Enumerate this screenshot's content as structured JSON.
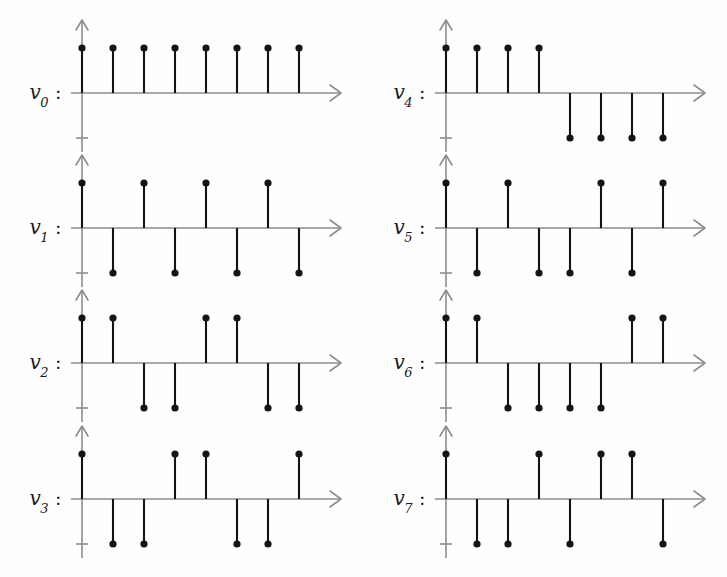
{
  "figure": {
    "columns": 2,
    "rows": 4,
    "background_color": "#fefefe",
    "stem_color": "#141414",
    "axis_color": "#8d8d8d"
  },
  "chart_data": {
    "type": "bar",
    "title": "",
    "xlabel": "",
    "ylabel": "",
    "ylim": [
      -1,
      1
    ],
    "grid": false,
    "legend": "none",
    "x": [
      0,
      1,
      2,
      3,
      4,
      5,
      6,
      7
    ],
    "series": [
      {
        "name": "v0",
        "values": [
          1,
          1,
          1,
          1,
          1,
          1,
          1,
          1
        ]
      },
      {
        "name": "v1",
        "values": [
          1,
          -1,
          1,
          -1,
          1,
          -1,
          1,
          -1
        ]
      },
      {
        "name": "v2",
        "values": [
          1,
          1,
          -1,
          -1,
          1,
          1,
          -1,
          -1
        ]
      },
      {
        "name": "v3",
        "values": [
          1,
          -1,
          -1,
          1,
          1,
          -1,
          -1,
          1
        ]
      },
      {
        "name": "v4",
        "values": [
          1,
          1,
          1,
          1,
          -1,
          -1,
          -1,
          -1
        ]
      },
      {
        "name": "v5",
        "values": [
          1,
          -1,
          1,
          -1,
          -1,
          1,
          -1,
          1
        ]
      },
      {
        "name": "v6",
        "values": [
          1,
          1,
          -1,
          -1,
          -1,
          -1,
          1,
          1
        ]
      },
      {
        "name": "v7",
        "values": [
          1,
          -1,
          -1,
          1,
          -1,
          1,
          1,
          -1
        ]
      }
    ]
  },
  "panels": [
    {
      "id": "v0",
      "label_base": "v",
      "label_sub": "0",
      "label_colon": ":",
      "values": [
        1,
        1,
        1,
        1,
        1,
        1,
        1,
        1
      ]
    },
    {
      "id": "v1",
      "label_base": "v",
      "label_sub": "1",
      "label_colon": ":",
      "values": [
        1,
        -1,
        1,
        -1,
        1,
        -1,
        1,
        -1
      ]
    },
    {
      "id": "v2",
      "label_base": "v",
      "label_sub": "2",
      "label_colon": ":",
      "values": [
        1,
        1,
        -1,
        -1,
        1,
        1,
        -1,
        -1
      ]
    },
    {
      "id": "v3",
      "label_base": "v",
      "label_sub": "3",
      "label_colon": ":",
      "values": [
        1,
        -1,
        -1,
        1,
        1,
        -1,
        -1,
        1
      ]
    },
    {
      "id": "v4",
      "label_base": "v",
      "label_sub": "4",
      "label_colon": ":",
      "values": [
        1,
        1,
        1,
        1,
        -1,
        -1,
        -1,
        -1
      ]
    },
    {
      "id": "v5",
      "label_base": "v",
      "label_sub": "5",
      "label_colon": ":",
      "values": [
        1,
        -1,
        1,
        -1,
        -1,
        1,
        -1,
        1
      ]
    },
    {
      "id": "v6",
      "label_base": "v",
      "label_sub": "6",
      "label_colon": ":",
      "values": [
        1,
        1,
        -1,
        -1,
        -1,
        -1,
        1,
        1
      ]
    },
    {
      "id": "v7",
      "label_base": "v",
      "label_sub": "7",
      "label_colon": ":",
      "values": [
        1,
        -1,
        -1,
        1,
        -1,
        1,
        1,
        -1
      ]
    }
  ]
}
